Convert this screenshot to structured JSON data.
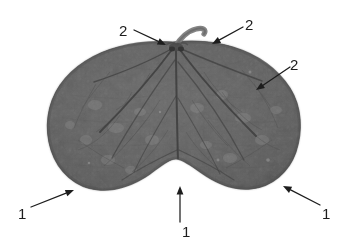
{
  "figure": {
    "name": "leaf-specimen-annotated-photograph",
    "background_color": "#ffffff",
    "leaf_color": "#6a6a6a",
    "leaf_edge_color": "#4d4d4d",
    "vein_color": "#3a3a3a",
    "annotation_color": "#1d1d1d"
  },
  "annotations": [
    {
      "id": "callout-2-top-left",
      "label": "2",
      "label_x": 119,
      "label_y": 23,
      "tail_x": 134,
      "tail_y": 30,
      "head_x": 166,
      "head_y": 45
    },
    {
      "id": "callout-2-top-right",
      "label": "2",
      "label_x": 245,
      "label_y": 17,
      "tail_x": 243,
      "tail_y": 27,
      "head_x": 212,
      "head_y": 44
    },
    {
      "id": "callout-2-right-lobe",
      "label": "2",
      "label_x": 290,
      "label_y": 57,
      "tail_x": 290,
      "tail_y": 67,
      "head_x": 256,
      "head_y": 90
    },
    {
      "id": "callout-1-bottom-left",
      "label": "1",
      "label_x": 18,
      "label_y": 206,
      "tail_x": 31,
      "tail_y": 207,
      "head_x": 74,
      "head_y": 190
    },
    {
      "id": "callout-1-bottom-center",
      "label": "1",
      "label_x": 182,
      "label_y": 224,
      "tail_x": 180,
      "tail_y": 222,
      "head_x": 180,
      "head_y": 186
    },
    {
      "id": "callout-1-bottom-right",
      "label": "1",
      "label_x": 322,
      "label_y": 206,
      "tail_x": 320,
      "tail_y": 205,
      "head_x": 283,
      "head_y": 186
    }
  ]
}
